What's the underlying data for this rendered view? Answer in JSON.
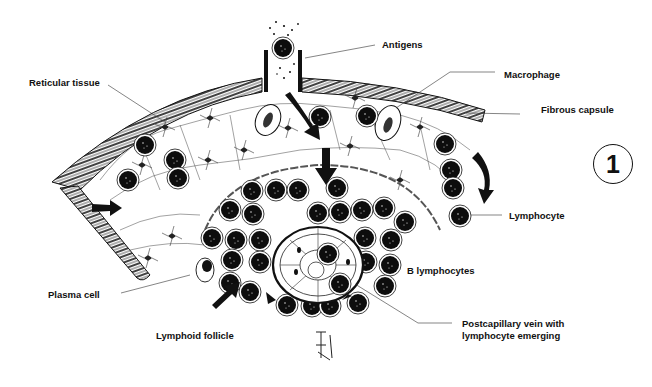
{
  "figure": {
    "number": "1"
  },
  "labels": {
    "antigens": "Antigens",
    "reticular_tissue": "Reticular tissue",
    "macrophage": "Macrophage",
    "fibrous_capsule": "Fibrous capsule",
    "lymphocyte": "Lymphocyte",
    "b_lymphocytes": "B lymphocytes",
    "plasma_cell": "Plasma cell",
    "lymphoid_follicle": "Lymphoid follicle",
    "postcapillary_vein_line1": "Postcapillary vein with",
    "postcapillary_vein_line2": "lymphocyte emerging"
  },
  "colors": {
    "ink": "#111111",
    "background": "#ffffff"
  }
}
